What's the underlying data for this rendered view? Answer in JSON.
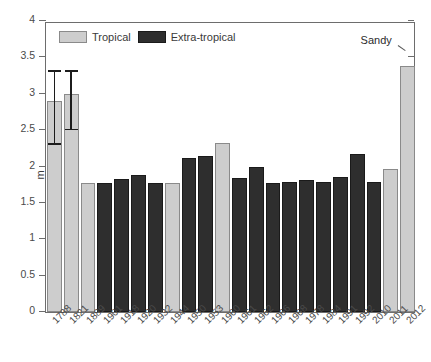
{
  "chart_data": {
    "type": "bar",
    "title": "",
    "xlabel": "",
    "ylabel": "m",
    "ylim": [
      0,
      4
    ],
    "yticks": [
      "0",
      "0.5",
      "1",
      "1.5",
      "2",
      "2.5",
      "3",
      "3.5",
      "4"
    ],
    "ytick_values": [
      0,
      0.5,
      1,
      1.5,
      2,
      2.5,
      3,
      3.5,
      4
    ],
    "grid": false,
    "legend_position": "top-left",
    "legend": [
      "Tropical",
      "Extra-tropical"
    ],
    "categories": [
      "1788",
      "1821",
      "1889",
      "1901",
      "1918",
      "1920",
      "1932",
      "1944",
      "1950",
      "1953",
      "1960",
      "1961",
      "1962",
      "1966",
      "1968",
      "1978",
      "1984",
      "1991",
      "1992",
      "2010",
      "2011",
      "2012"
    ],
    "values": [
      2.9,
      3.0,
      1.77,
      1.78,
      1.83,
      1.88,
      1.78,
      1.78,
      2.12,
      2.15,
      2.33,
      1.84,
      1.99,
      1.78,
      1.79,
      1.82,
      1.79,
      1.85,
      2.17,
      1.79,
      1.97,
      3.38
    ],
    "types": [
      "Tropical",
      "Tropical",
      "Tropical",
      "Extra-tropical",
      "Extra-tropical",
      "Extra-tropical",
      "Extra-tropical",
      "Tropical",
      "Extra-tropical",
      "Extra-tropical",
      "Tropical",
      "Extra-tropical",
      "Extra-tropical",
      "Extra-tropical",
      "Extra-tropical",
      "Extra-tropical",
      "Extra-tropical",
      "Extra-tropical",
      "Extra-tropical",
      "Extra-tropical",
      "Tropical",
      "Tropical"
    ],
    "error_bars": [
      {
        "category": "1788",
        "index": 0,
        "low": 2.3,
        "high": 3.3
      },
      {
        "category": "1821",
        "index": 1,
        "low": 2.5,
        "high": 3.3
      }
    ],
    "annotations": [
      {
        "text": "Sandy",
        "category": "2012",
        "value": 3.38
      }
    ],
    "colors": {
      "tropical": "#cdcdcd",
      "extra_tropical": "#2e2e2e",
      "axis": "#6d6d6d",
      "text": "#3a3a3a",
      "error_bar": "#1c1c1c",
      "background": "#ffffff"
    }
  }
}
